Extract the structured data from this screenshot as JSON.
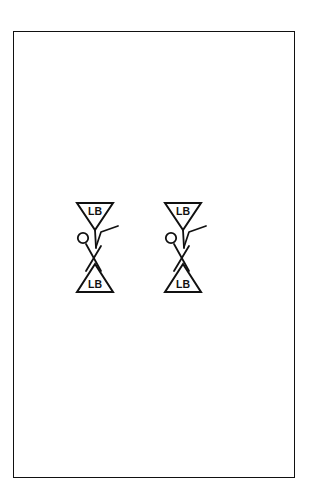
{
  "page": {
    "background_color": "#ffffff",
    "width": 309,
    "height": 503
  },
  "frame": {
    "name": "page-frame",
    "stroke_color": "#111111",
    "fill_color": "#ffffff",
    "stroke_width": 1.5,
    "x": 13,
    "y": 31,
    "width": 282,
    "height": 447
  },
  "diagram": {
    "line_color": "#111111",
    "figure_count": 2,
    "figures": [
      {
        "id": "figure-left",
        "top_triangle_label": "LB",
        "bottom_triangle_label": "LB",
        "offset_x": 0
      },
      {
        "id": "figure-right",
        "top_triangle_label": "LB",
        "bottom_triangle_label": "LB",
        "offset_x": 88
      }
    ]
  },
  "labels": {
    "left_top": "LB",
    "left_bottom": "LB",
    "right_top": "LB",
    "right_bottom": "LB"
  }
}
